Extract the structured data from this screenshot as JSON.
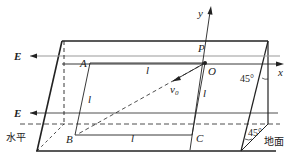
{
  "diagram": {
    "type": "physics-geometry",
    "labels": {
      "y_axis": "y",
      "x_axis": "x",
      "origin": "O",
      "point_p": "P",
      "corner_a": "A",
      "corner_b": "B",
      "corner_c": "C",
      "side_top": "l",
      "side_left": "l",
      "side_right": "l",
      "side_bottom": "l",
      "velocity": "v",
      "velocity_sub": "0",
      "field_upper": "E",
      "field_lower": "E",
      "angle_upper": "45°",
      "angle_lower": "45°",
      "horizontal": "水平",
      "ground": "地面"
    },
    "colors": {
      "line": "#222222",
      "field_line": "#999999"
    }
  }
}
